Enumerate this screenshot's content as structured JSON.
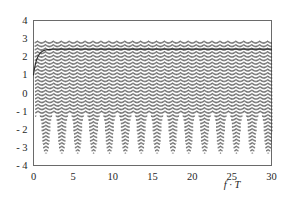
{
  "chart_data": {
    "type": "line",
    "title": "",
    "subtitle": "",
    "xlabel": "f · T",
    "ylabel": "",
    "xlim": [
      0,
      30
    ],
    "ylim": [
      -4,
      4
    ],
    "grid": false,
    "legend": null,
    "x_ticks": [
      0,
      5,
      10,
      15,
      20,
      25,
      30
    ],
    "x_tick_labels": [
      "0",
      "5",
      "10",
      "15",
      "20",
      "25",
      "30"
    ],
    "y_ticks": [
      4,
      3,
      2,
      1,
      0,
      -1,
      -2,
      -3,
      -4
    ],
    "y_tick_labels": [
      "4",
      "3",
      "2",
      "1",
      "0",
      "- 1",
      "- 2",
      "- 3",
      "- 4"
    ],
    "frame": true,
    "series": [
      {
        "name": "oscillating-samples",
        "style": "dashed-vertical-traces",
        "color": "#3a3a3a",
        "description": "Densely sampled rapidly oscillating trace drawn as near-vertical dashed strokes filling the band between the lower envelope and the upper envelope.",
        "sample_spacing_fT": 0.1,
        "upper_envelope_value": 2.9,
        "lower_envelope_min": -3.35,
        "lower_envelope_max": -1.1,
        "lower_envelope_period_fT": 2.0,
        "onset_fT": 0.2
      },
      {
        "name": "mean-curve",
        "style": "solid",
        "color": "#2b2b2b",
        "description": "Smooth monotonic curve rising steeply from about 1.0 at f·T = 0 and saturating at about 2.42.",
        "asymptote": 2.42,
        "start_value": 1.0,
        "rise_constant_fT": 0.45,
        "points": [
          {
            "x": 0.0,
            "y": 1.0
          },
          {
            "x": 0.2,
            "y": 1.62
          },
          {
            "x": 0.4,
            "y": 1.98
          },
          {
            "x": 0.6,
            "y": 2.17
          },
          {
            "x": 0.8,
            "y": 2.27
          },
          {
            "x": 1.0,
            "y": 2.33
          },
          {
            "x": 1.5,
            "y": 2.39
          },
          {
            "x": 2.0,
            "y": 2.41
          },
          {
            "x": 3.0,
            "y": 2.42
          },
          {
            "x": 5.0,
            "y": 2.42
          },
          {
            "x": 10.0,
            "y": 2.42
          },
          {
            "x": 15.0,
            "y": 2.42
          },
          {
            "x": 20.0,
            "y": 2.42
          },
          {
            "x": 25.0,
            "y": 2.42
          },
          {
            "x": 30.0,
            "y": 2.42
          }
        ]
      }
    ]
  },
  "figure": {
    "background_color": "#ffffff",
    "frame_color": "#5a5a5a",
    "text_color": "#1f1f1f",
    "trace_color": "#3a3a3a",
    "curve_color": "#2b2b2b"
  }
}
